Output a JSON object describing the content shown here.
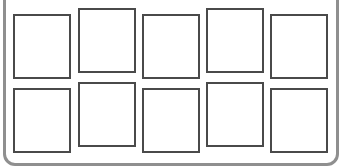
{
  "diagram": {
    "frame": {
      "border_color": "#8f8f8f"
    },
    "box_style": {
      "border_color": "#4a4a4a",
      "fill": "#ffffff"
    },
    "rows": [
      {
        "boxes": [
          {
            "x": 13,
            "y": 14
          },
          {
            "x": 78,
            "y": 8
          },
          {
            "x": 142,
            "y": 14
          },
          {
            "x": 206,
            "y": 8
          },
          {
            "x": 270,
            "y": 14
          }
        ]
      },
      {
        "boxes": [
          {
            "x": 13,
            "y": 88
          },
          {
            "x": 78,
            "y": 82
          },
          {
            "x": 142,
            "y": 88
          },
          {
            "x": 206,
            "y": 82
          },
          {
            "x": 270,
            "y": 88
          }
        ]
      }
    ]
  }
}
